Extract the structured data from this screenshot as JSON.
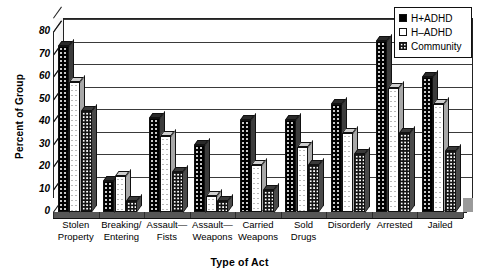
{
  "chart_data": {
    "type": "bar",
    "title": "",
    "xlabel": "Type of Act",
    "ylabel": "Percent of Group",
    "ylim": [
      0,
      80
    ],
    "yticks": [
      0,
      10,
      20,
      30,
      40,
      50,
      60,
      70,
      80
    ],
    "grid": true,
    "legend_position": "top-right",
    "categories": [
      "Stolen Property",
      "Breaking/ Entering",
      "Assault— Fists",
      "Assault— Weapons",
      "Carried Weapons",
      "Sold Drugs",
      "Disorderly",
      "Arrested",
      "Jailed"
    ],
    "category_lines": [
      [
        "Stolen",
        "Property"
      ],
      [
        "Breaking/",
        "Entering"
      ],
      [
        "Assault—",
        "Fists"
      ],
      [
        "Assault—",
        "Weapons"
      ],
      [
        "Carried",
        "Weapons"
      ],
      [
        "Sold",
        "Drugs"
      ],
      [
        "Disorderly",
        ""
      ],
      [
        "Arrested",
        ""
      ],
      [
        "Jailed",
        ""
      ]
    ],
    "series": [
      {
        "name": "H+ADHD",
        "swatch": "solid-black",
        "values": [
          74,
          14,
          42,
          30,
          41,
          41,
          48,
          76,
          60
        ]
      },
      {
        "name": "H–ADHD",
        "swatch": "white-dotted",
        "values": [
          58,
          16,
          34,
          7,
          21,
          29,
          35,
          55,
          48
        ]
      },
      {
        "name": "Community",
        "swatch": "dark-dotted",
        "values": [
          45,
          5,
          18,
          5,
          10,
          21,
          26,
          35,
          27
        ]
      }
    ]
  },
  "legend": {
    "entries": [
      {
        "label": "H+ADHD"
      },
      {
        "label": "H–ADHD"
      },
      {
        "label": "Community"
      }
    ]
  },
  "axes": {
    "y_title": "Percent of Group",
    "x_title": "Type of Act"
  }
}
